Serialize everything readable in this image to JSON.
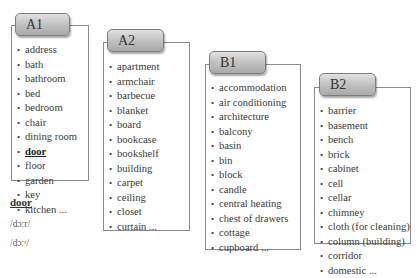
{
  "levels": [
    {
      "label": "A1",
      "words": [
        "address",
        "bath",
        "bathroom",
        "bed",
        "bedroom",
        "chair",
        "dining room",
        "door",
        "floor",
        "garden",
        "key",
        "kitchen ..."
      ],
      "active_index": 7
    },
    {
      "label": "A2",
      "words": [
        "apartment",
        "armchair",
        "barbecue",
        "blanket",
        "board",
        "bookcase",
        "bookshelf",
        "building",
        "carpet",
        "ceiling",
        "closet",
        "curtain ..."
      ]
    },
    {
      "label": "B1",
      "words": [
        "accommodation",
        "air conditioning",
        "architecture",
        "balcony",
        "basin",
        "bin",
        "block",
        "candle",
        "central heating",
        "chest of drawers",
        "cottage",
        "cupboard ..."
      ]
    },
    {
      "label": "B2",
      "words": [
        "barrier",
        "basement",
        "bench",
        "brick",
        "cabinet",
        "cell",
        "cellar",
        "chimney",
        "cloth (for cleaning)",
        "column (building)",
        "corridor",
        "domestic ..."
      ]
    }
  ],
  "entry": {
    "headword": "door",
    "pronunciation_us": "/dɔːr/",
    "pronunciation_uk": "/dɔːʳ/"
  },
  "bullet": "•"
}
